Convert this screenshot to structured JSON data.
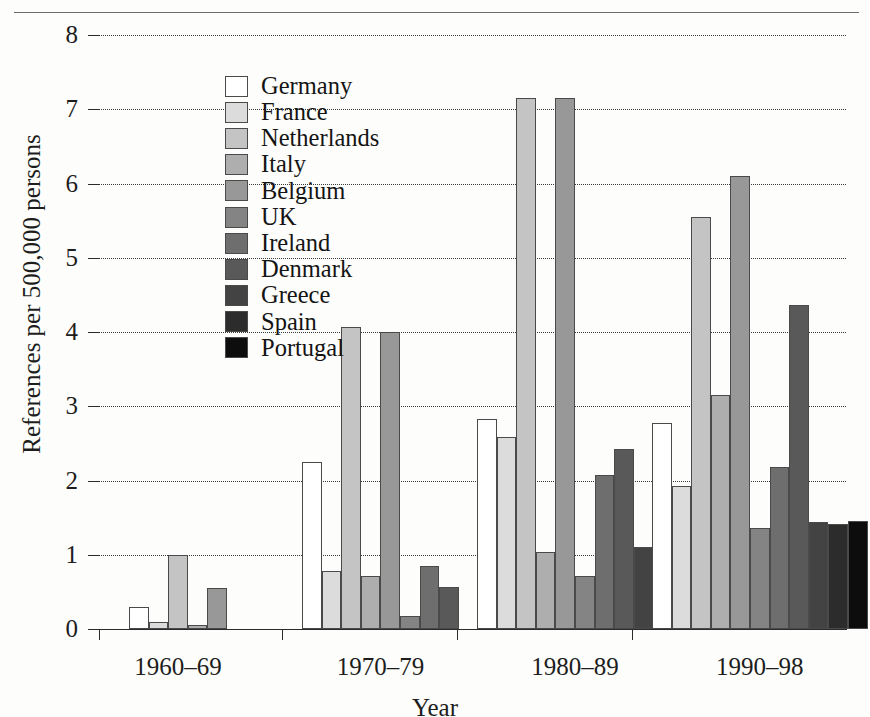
{
  "figure": {
    "top_rule": "",
    "yaxis_title": "References per 500,000 persons",
    "xaxis_title": "Year",
    "y_ticks": [
      "0",
      "1",
      "2",
      "3",
      "4",
      "5",
      "6",
      "7",
      "8"
    ],
    "x_tick_labels": [
      "1960–69",
      "1970–79",
      "1980–89",
      "1990–98"
    ]
  },
  "legend": {
    "items": [
      {
        "label": "Germany",
        "color": "#ffffff"
      },
      {
        "label": "France",
        "color": "#dcdcdc"
      },
      {
        "label": "Netherlands",
        "color": "#c4c4c4"
      },
      {
        "label": "Italy",
        "color": "#aeaeae"
      },
      {
        "label": "Belgium",
        "color": "#989898"
      },
      {
        "label": "UK",
        "color": "#848484"
      },
      {
        "label": "Ireland",
        "color": "#6e6e6e"
      },
      {
        "label": "Denmark",
        "color": "#595959"
      },
      {
        "label": "Greece",
        "color": "#434343"
      },
      {
        "label": "Spain",
        "color": "#2c2c2c"
      },
      {
        "label": "Portugal",
        "color": "#0d0d0d"
      }
    ]
  },
  "chart_data": {
    "type": "bar",
    "title": "",
    "xlabel": "Year",
    "ylabel": "References per 500,000 persons",
    "ylim": [
      0,
      8
    ],
    "ytick_step": 1,
    "grid": true,
    "grid_style": "dotted-horizontal",
    "legend_position": "inside-upper-left",
    "categories": [
      "1960–69",
      "1970–79",
      "1980–89",
      "1990–98"
    ],
    "series": [
      {
        "name": "Germany",
        "color": "#ffffff",
        "values": [
          0.3,
          2.25,
          2.83,
          2.77
        ]
      },
      {
        "name": "France",
        "color": "#dcdcdc",
        "values": [
          0.1,
          0.78,
          2.58,
          1.93
        ]
      },
      {
        "name": "Netherlands",
        "color": "#c4c4c4",
        "values": [
          1.0,
          4.07,
          7.15,
          5.55
        ]
      },
      {
        "name": "Italy",
        "color": "#aeaeae",
        "values": [
          0.05,
          0.72,
          1.04,
          3.15
        ]
      },
      {
        "name": "Belgium",
        "color": "#989898",
        "values": [
          0.55,
          4.0,
          7.15,
          6.1
        ]
      },
      {
        "name": "UK",
        "color": "#848484",
        "values": [
          null,
          0.18,
          0.72,
          1.36
        ]
      },
      {
        "name": "Ireland",
        "color": "#6e6e6e",
        "values": [
          null,
          0.85,
          2.07,
          2.18
        ]
      },
      {
        "name": "Denmark",
        "color": "#595959",
        "values": [
          null,
          0.57,
          2.42,
          4.37
        ]
      },
      {
        "name": "Greece",
        "color": "#434343",
        "values": [
          null,
          null,
          1.1,
          1.44
        ]
      },
      {
        "name": "Spain",
        "color": "#2c2c2c",
        "values": [
          null,
          null,
          0.05,
          1.42
        ]
      },
      {
        "name": "Portugal",
        "color": "#0d0d0d",
        "values": [
          null,
          null,
          null,
          1.46
        ]
      }
    ]
  }
}
